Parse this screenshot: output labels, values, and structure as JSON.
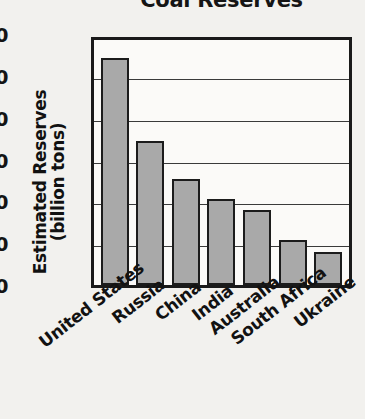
{
  "chart_data": {
    "type": "bar",
    "title": "Coal Reserves",
    "xlabel": "",
    "ylabel": "Estimated Reserves (billion tons)",
    "ylabel_line1": "Estimated Reserves",
    "ylabel_line2": "(billion tons)",
    "categories": [
      "United States",
      "Russia",
      "China",
      "India",
      "Australia",
      "South Africa",
      "Ukraine"
    ],
    "values": [
      275,
      176,
      130,
      106,
      93,
      57,
      43
    ],
    "ylim": [
      0,
      300
    ],
    "ytick_labels": [
      "300",
      "250",
      "200",
      "150",
      "100",
      "50",
      "0"
    ],
    "ytick_values": [
      300,
      250,
      200,
      150,
      100,
      50,
      0
    ],
    "grid": true,
    "legend": "none",
    "bar_fill_color": "#a9a9a9",
    "bar_border_color": "#1c1c1c",
    "axis_color": "#1a1a1a",
    "background_color": "#f2f1ee"
  }
}
